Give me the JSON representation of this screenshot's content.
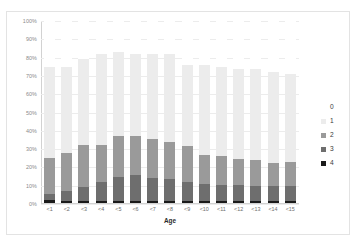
{
  "caption_sliver": "",
  "chart_data": {
    "type": "bar",
    "subtype": "stacked-percentage",
    "title": "",
    "xlabel": "Age",
    "ylabel": "",
    "ylim": [
      0,
      100
    ],
    "ytick_labels": [
      "100%",
      "90%",
      "80%",
      "70%",
      "60%",
      "50%",
      "40%",
      "30%",
      "20%",
      "10%",
      "0%"
    ],
    "ytick_values": [
      100,
      90,
      80,
      70,
      60,
      50,
      40,
      30,
      20,
      10,
      0
    ],
    "grid": true,
    "legend_position": "right",
    "categories": [
      "<1",
      "<2",
      "<3",
      "<4",
      "<5",
      "<6",
      "<7",
      "<8",
      "<9",
      "<10",
      "<11",
      "<12",
      "<13",
      "<14",
      "<15"
    ],
    "series": [
      {
        "name": "4",
        "color": "#1a1a1a",
        "values": [
          2.0,
          1.8,
          1.8,
          1.8,
          1.8,
          1.8,
          1.8,
          1.8,
          1.8,
          1.8,
          1.8,
          1.8,
          1.8,
          1.8,
          1.8
        ]
      },
      {
        "name": "3",
        "color": "#6e6e6e",
        "values": [
          3.5,
          5.5,
          7.5,
          10.5,
          13.0,
          14.0,
          12.5,
          12.0,
          10.5,
          9.0,
          8.5,
          8.5,
          8.0,
          8.0,
          8.0
        ]
      },
      {
        "name": "2",
        "color": "#9a9a9a",
        "values": [
          19.5,
          20.5,
          23.0,
          20.0,
          22.5,
          21.5,
          21.5,
          20.0,
          19.5,
          16.0,
          16.0,
          14.5,
          14.5,
          12.5,
          13.0
        ]
      },
      {
        "name": "1",
        "color": "#ececec",
        "values": [
          50.0,
          47.2,
          46.7,
          49.7,
          45.7,
          44.7,
          46.2,
          48.2,
          44.2,
          49.2,
          48.7,
          49.2,
          49.7,
          49.7,
          48.2
        ]
      },
      {
        "name": "0",
        "color": "#ffffff",
        "values": [
          25.0,
          25.0,
          21.0,
          18.0,
          17.0,
          18.0,
          18.0,
          18.0,
          24.0,
          24.0,
          25.0,
          26.0,
          26.0,
          28.0,
          29.0
        ]
      }
    ],
    "bar_totals_visible": [
      75.0,
      75.0,
      79.0,
      82.0,
      83.0,
      82.0,
      82.0,
      82.0,
      76.0,
      76.0,
      75.0,
      74.0,
      74.0,
      72.0,
      71.0
    ],
    "legend_entries": [
      {
        "label": "0",
        "color": "#ffffff"
      },
      {
        "label": "1",
        "color": "#ececec"
      },
      {
        "label": "2",
        "color": "#9a9a9a"
      },
      {
        "label": "3",
        "color": "#6e6e6e"
      },
      {
        "label": "4",
        "color": "#1a1a1a"
      }
    ]
  }
}
